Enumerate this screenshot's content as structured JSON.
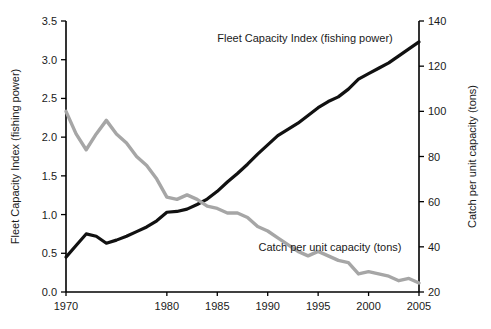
{
  "chart_data": {
    "type": "line",
    "title": "",
    "xlabel": "",
    "xlim": [
      1970,
      2005
    ],
    "xticks": [
      1970,
      1980,
      1985,
      1990,
      1995,
      2000,
      2005
    ],
    "xticklabels": [
      "1970",
      "1980",
      "1985",
      "1990",
      "1995",
      "2000",
      "2005"
    ],
    "grid": false,
    "legend_position": "inline-annotations",
    "axes": [
      {
        "id": "left",
        "label": "Fleet Capacity Index (fishing power)",
        "ylim": [
          0.0,
          3.5
        ],
        "yticks": [
          0.0,
          0.5,
          1.0,
          1.5,
          2.0,
          2.5,
          3.0,
          3.5
        ],
        "yticklabels": [
          "0.0",
          "0.5",
          "1.0",
          "1.5",
          "2.0",
          "2.5",
          "3.0",
          "3.5"
        ]
      },
      {
        "id": "right",
        "label": "Catch per unit capacity  (tons)",
        "ylim": [
          20,
          140
        ],
        "yticks": [
          20,
          40,
          60,
          80,
          100,
          120,
          140
        ],
        "yticklabels": [
          "20",
          "40",
          "60",
          "80",
          "100",
          "120",
          "140"
        ]
      }
    ],
    "x": [
      1970,
      1971,
      1972,
      1973,
      1974,
      1975,
      1976,
      1977,
      1978,
      1979,
      1980,
      1981,
      1982,
      1983,
      1984,
      1985,
      1986,
      1987,
      1988,
      1989,
      1990,
      1991,
      1992,
      1993,
      1994,
      1995,
      1996,
      1997,
      1998,
      1999,
      2000,
      2001,
      2002,
      2003,
      2004,
      2005
    ],
    "series": [
      {
        "name": "Fleet Capacity Index (fishing power)",
        "axis": "left",
        "color": "#111111",
        "units": "index",
        "annotation": "Fleet Capacity Index (fishing power)",
        "values": [
          0.45,
          0.6,
          0.75,
          0.72,
          0.63,
          0.67,
          0.72,
          0.78,
          0.84,
          0.92,
          1.03,
          1.04,
          1.07,
          1.13,
          1.2,
          1.3,
          1.42,
          1.53,
          1.65,
          1.78,
          1.9,
          2.02,
          2.1,
          2.18,
          2.28,
          2.38,
          2.46,
          2.52,
          2.62,
          2.75,
          2.82,
          2.89,
          2.96,
          3.05,
          3.14,
          3.23
        ]
      },
      {
        "name": "Catch per unit capacity (tons)",
        "axis": "right",
        "color": "#a6a6a6",
        "units": "tons",
        "annotation": "Catch per unit capacity (tons)",
        "values": [
          100,
          90,
          83,
          90,
          96,
          90,
          86,
          80,
          76,
          70,
          62,
          61,
          63,
          61,
          58,
          57,
          55,
          55,
          53,
          49,
          47,
          44,
          41,
          38,
          36,
          38,
          36,
          34,
          33,
          28,
          29,
          28,
          27,
          25,
          26,
          24
        ]
      }
    ]
  },
  "annotations": {
    "fleet_label": "Fleet Capacity Index (fishing power)",
    "catch_label": "Catch per unit capacity (tons)"
  },
  "colors": {
    "fleet_line": "#111111",
    "catch_line": "#a6a6a6",
    "axis": "#000000",
    "text": "#1a1a1a",
    "background": "#ffffff"
  }
}
